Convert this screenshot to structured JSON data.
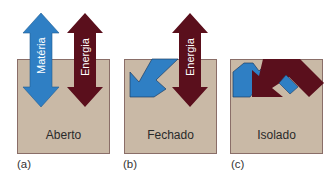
{
  "colors": {
    "box_fill": "#c9b9a6",
    "box_border": "#8a6e68",
    "materia_arrow": "#2f7fc4",
    "energia_arrow": "#5a0f1c"
  },
  "panels": [
    {
      "id": "a",
      "box_label": "Aberto",
      "sub_label": "(a)",
      "arrows": [
        {
          "name": "Matéria",
          "direction": "bidirectional",
          "color": "#2f7fc4"
        },
        {
          "name": "Energia",
          "direction": "bidirectional",
          "color": "#5a0f1c"
        }
      ]
    },
    {
      "id": "b",
      "box_label": "Fechado",
      "sub_label": "(b)",
      "arrows": [
        {
          "name": "Energia",
          "direction": "bidirectional",
          "color": "#5a0f1c"
        },
        {
          "name": "matter-bent",
          "direction": "contained",
          "color": "#2f7fc4"
        }
      ]
    },
    {
      "id": "c",
      "box_label": "Isolado",
      "sub_label": "(c)",
      "arrows": [
        {
          "name": "matter-bent",
          "direction": "contained",
          "color": "#2f7fc4"
        },
        {
          "name": "energy-bent",
          "direction": "contained",
          "color": "#5a0f1c"
        }
      ]
    }
  ],
  "labels": {
    "materia": "Matéria",
    "energia": "Energia"
  }
}
